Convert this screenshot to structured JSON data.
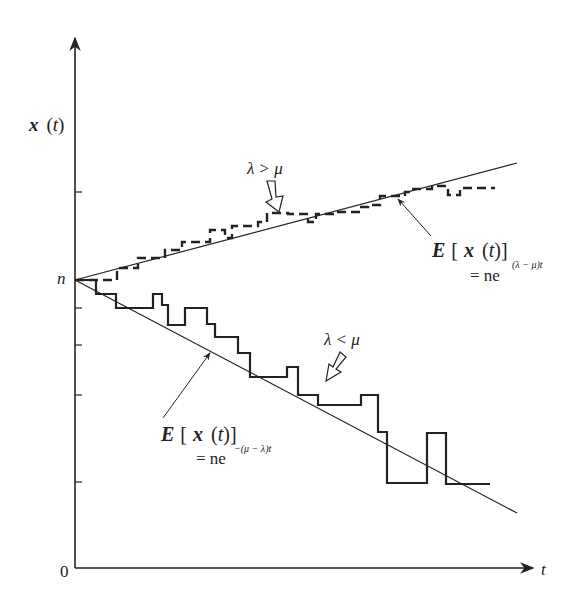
{
  "figure": {
    "type": "diagram",
    "y_axis_label": "x (t)",
    "x_axis_label": "t",
    "origin_label": "0",
    "start_label": "n",
    "upper_case": {
      "condition": "λ > μ",
      "expectation_label": "E [ x (t)]",
      "expectation_formula_prefix": "= ne",
      "expectation_exponent": "(λ − μ)t",
      "path_style": "dashed"
    },
    "lower_case": {
      "condition": "λ < μ",
      "expectation_label": "E [ x (t)]",
      "expectation_formula_prefix": "= ne",
      "expectation_exponent": "−(μ − λ)t",
      "path_style": "solid"
    },
    "colors": {
      "ink": "#222222",
      "background": "#ffffff"
    }
  }
}
